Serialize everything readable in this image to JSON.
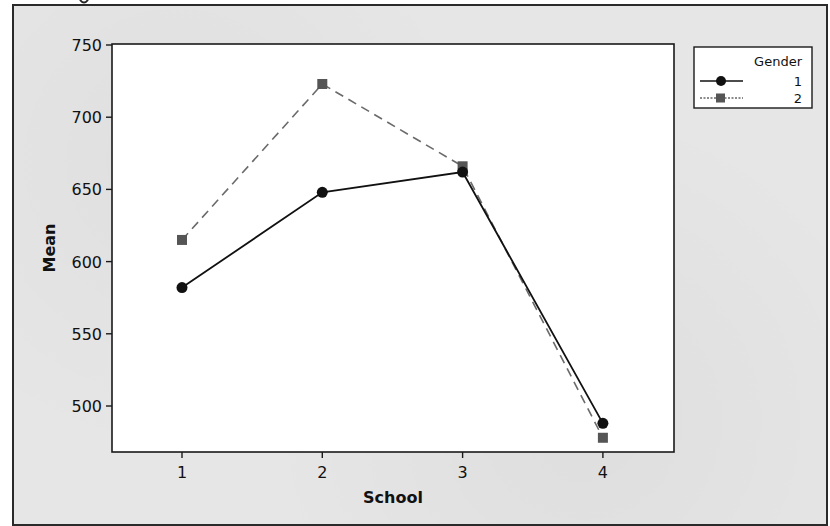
{
  "chart_data": {
    "type": "line",
    "title": "",
    "xlabel": "School",
    "ylabel": "Mean",
    "x": [
      1,
      2,
      3,
      4
    ],
    "categories": [
      "1",
      "2",
      "3",
      "4"
    ],
    "series": [
      {
        "name": "1",
        "values": [
          582,
          648,
          662,
          488
        ],
        "marker": "circle",
        "line": "solid",
        "color": "#111111"
      },
      {
        "name": "2",
        "values": [
          615,
          723,
          666,
          478
        ],
        "marker": "square",
        "line": "dashed",
        "color": "#555555"
      }
    ],
    "ylim": [
      486,
      750
    ],
    "yticks": [
      500,
      550,
      600,
      650,
      700,
      750
    ],
    "xticks": [
      1,
      2,
      3,
      4
    ],
    "grid": false,
    "legend": {
      "title": "Gender",
      "position": "upper-right-outside",
      "entries": [
        "1",
        "2"
      ]
    }
  },
  "labels": {
    "xlabel": "School",
    "ylabel": "Mean",
    "legend_title": "Gender",
    "legend_entry_1": "1",
    "legend_entry_2": "2",
    "xticks": [
      "1",
      "2",
      "3",
      "4"
    ],
    "yticks": [
      "500",
      "550",
      "600",
      "650",
      "700",
      "750"
    ]
  }
}
